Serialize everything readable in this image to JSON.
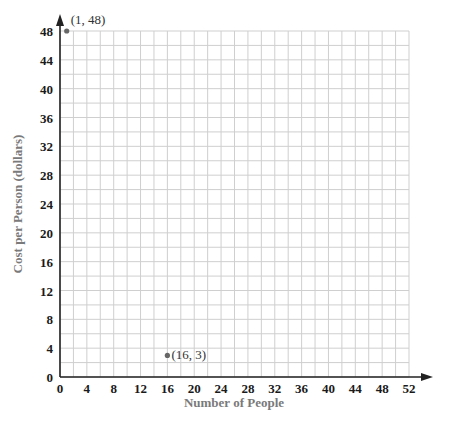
{
  "chart_data": {
    "type": "scatter",
    "title": "",
    "xlabel": "Number of People",
    "ylabel": "Cost per Person (dollars)",
    "xlim": [
      0,
      52
    ],
    "ylim": [
      0,
      48
    ],
    "x_ticks": [
      0,
      4,
      8,
      12,
      16,
      20,
      24,
      28,
      32,
      36,
      40,
      44,
      48,
      52
    ],
    "y_ticks": [
      0,
      4,
      8,
      12,
      16,
      20,
      24,
      28,
      32,
      36,
      40,
      44,
      48
    ],
    "grid": true,
    "grid_step": 2,
    "points": [
      {
        "x": 1,
        "y": 48,
        "label": "(1, 48)"
      },
      {
        "x": 16,
        "y": 3,
        "label": "(16, 3)"
      }
    ],
    "colors": {
      "grid": "#cfcfcf",
      "axis": "#222222",
      "point": "#666666",
      "axis_label": "#7a7a7a"
    }
  }
}
